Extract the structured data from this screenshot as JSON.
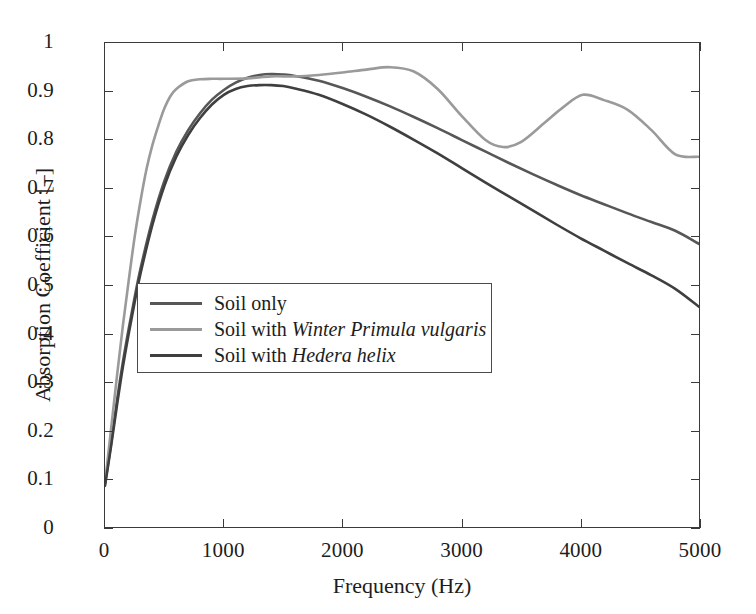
{
  "chart_data": {
    "type": "line",
    "title": "",
    "xlabel": "Frequency (Hz)",
    "ylabel": "Absorption Coefficient [–]",
    "xlim": [
      0,
      5000
    ],
    "ylim": [
      0,
      1
    ],
    "xticks": [
      0,
      1000,
      2000,
      3000,
      4000,
      5000
    ],
    "xticklabels": [
      "0",
      "1000",
      "2000",
      "3000",
      "4000",
      "5000"
    ],
    "yticks": [
      0,
      0.1,
      0.2,
      0.3,
      0.4,
      0.5,
      0.6,
      0.7,
      0.8,
      0.9,
      1
    ],
    "yticklabels": [
      "0",
      "0.1",
      "0.2",
      "0.3",
      "0.4",
      "0.5",
      "0.6",
      "0.7",
      "0.8",
      "0.9",
      "1"
    ],
    "grid": false,
    "legend_position": "center-left",
    "series": [
      {
        "name": "Soil only",
        "label_plain": "Soil only",
        "label_prefix": "Soil only",
        "label_italic": "",
        "color": "#575757",
        "x": [
          0,
          50,
          100,
          150,
          200,
          250,
          300,
          400,
          500,
          600,
          700,
          800,
          900,
          1000,
          1100,
          1200,
          1300,
          1400,
          1500,
          1600,
          1800,
          2000,
          2200,
          2400,
          2600,
          2800,
          3000,
          3200,
          3400,
          3600,
          3800,
          4000,
          4200,
          4400,
          4600,
          4800,
          5000
        ],
        "y": [
          0.09,
          0.17,
          0.26,
          0.34,
          0.41,
          0.475,
          0.535,
          0.635,
          0.715,
          0.775,
          0.82,
          0.855,
          0.883,
          0.903,
          0.918,
          0.928,
          0.934,
          0.936,
          0.935,
          0.932,
          0.922,
          0.907,
          0.889,
          0.869,
          0.847,
          0.824,
          0.8,
          0.776,
          0.752,
          0.729,
          0.707,
          0.686,
          0.667,
          0.648,
          0.63,
          0.612,
          0.585
        ]
      },
      {
        "name": "Soil with Winter Primula vulgaris",
        "label_plain": "Soil with Winter Primula vulgaris",
        "label_prefix": "Soil with ",
        "label_italic": "Winter Primula vulgaris",
        "color": "#9a9a9a",
        "x": [
          0,
          50,
          100,
          150,
          200,
          250,
          300,
          350,
          400,
          450,
          500,
          550,
          600,
          700,
          800,
          900,
          1000,
          1200,
          1400,
          1600,
          1800,
          2000,
          2200,
          2400,
          2600,
          2800,
          3000,
          3200,
          3350,
          3500,
          3700,
          3850,
          4020,
          4200,
          4400,
          4600,
          4800,
          5000
        ],
        "y": [
          0.09,
          0.2,
          0.31,
          0.415,
          0.51,
          0.6,
          0.675,
          0.74,
          0.79,
          0.83,
          0.865,
          0.89,
          0.905,
          0.921,
          0.925,
          0.926,
          0.926,
          0.927,
          0.931,
          0.931,
          0.934,
          0.939,
          0.945,
          0.95,
          0.941,
          0.905,
          0.85,
          0.8,
          0.785,
          0.795,
          0.835,
          0.866,
          0.893,
          0.882,
          0.862,
          0.82,
          0.77,
          0.765
        ]
      },
      {
        "name": "Soil with Hedera helix",
        "label_plain": "Soil with Hedera helix",
        "label_prefix": "Soil with ",
        "label_italic": "Hedera helix",
        "color": "#3f3f3f",
        "x": [
          0,
          50,
          100,
          150,
          200,
          250,
          300,
          400,
          500,
          600,
          700,
          800,
          900,
          1000,
          1100,
          1200,
          1300,
          1400,
          1500,
          1600,
          1800,
          2000,
          2200,
          2400,
          2600,
          2800,
          3000,
          3200,
          3400,
          3600,
          3800,
          4000,
          4200,
          4400,
          4600,
          4800,
          5000
        ],
        "y": [
          0.085,
          0.165,
          0.25,
          0.33,
          0.4,
          0.465,
          0.525,
          0.625,
          0.705,
          0.765,
          0.81,
          0.845,
          0.873,
          0.893,
          0.905,
          0.911,
          0.913,
          0.913,
          0.911,
          0.906,
          0.893,
          0.874,
          0.852,
          0.827,
          0.8,
          0.772,
          0.742,
          0.712,
          0.683,
          0.654,
          0.625,
          0.597,
          0.571,
          0.545,
          0.52,
          0.492,
          0.455
        ]
      }
    ]
  },
  "axes": {
    "frame_color": "#3a3a3a"
  }
}
